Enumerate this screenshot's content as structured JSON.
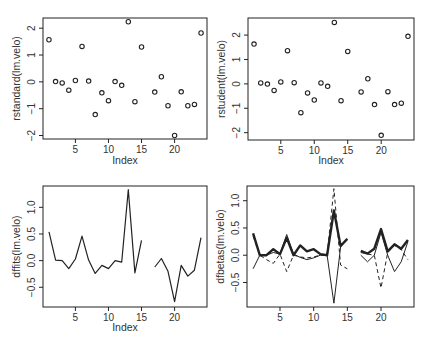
{
  "figure": {
    "layout": "2x2",
    "background": "#ffffff",
    "ink": "#222222"
  },
  "chart_data": [
    {
      "id": "rstandard",
      "type": "scatter",
      "title": "",
      "xlabel": "Index",
      "ylabel": "rstandard(lm.velo)",
      "xticks": [
        5,
        10,
        15,
        20
      ],
      "yticks": [
        -2,
        -1,
        0,
        1,
        2
      ],
      "ytick_labels": [
        "-2",
        "-1",
        "0",
        "1",
        "2"
      ],
      "xlim": [
        0.1,
        24.9
      ],
      "ylim": [
        -2.13,
        2.38
      ],
      "grid": false,
      "marker": "open-circle",
      "x": [
        1,
        2,
        3,
        4,
        5,
        6,
        7,
        8,
        9,
        10,
        11,
        12,
        13,
        14,
        15,
        16,
        17,
        18,
        19,
        20,
        21,
        22,
        23,
        24
      ],
      "values": [
        1.57,
        0.01,
        -0.04,
        -0.31,
        0.05,
        1.32,
        0.03,
        -1.22,
        -0.41,
        -0.7,
        0.01,
        -0.13,
        2.24,
        -0.74,
        1.3,
        null,
        -0.38,
        0.19,
        -0.89,
        -2.0,
        -0.37,
        -0.89,
        -0.84,
        1.82
      ]
    },
    {
      "id": "rstudent",
      "type": "scatter",
      "title": "",
      "xlabel": "Index",
      "ylabel": "rstudent(lm.velo)",
      "xticks": [
        5,
        10,
        15,
        20
      ],
      "yticks": [
        -2,
        -1,
        0,
        1,
        2
      ],
      "ytick_labels": [
        "-2",
        "-1",
        "0",
        "1",
        "2"
      ],
      "xlim": [
        0.1,
        24.9
      ],
      "ylim": [
        -2.3,
        2.7
      ],
      "grid": false,
      "marker": "open-circle",
      "x": [
        1,
        2,
        3,
        4,
        5,
        6,
        7,
        8,
        9,
        10,
        11,
        12,
        13,
        14,
        15,
        16,
        17,
        18,
        19,
        20,
        21,
        22,
        23,
        24
      ],
      "values": [
        1.63,
        0.04,
        -0.01,
        -0.27,
        0.08,
        1.36,
        0.05,
        -1.18,
        -0.37,
        -0.66,
        0.04,
        -0.1,
        2.52,
        -0.69,
        1.33,
        null,
        -0.33,
        0.21,
        -0.85,
        -2.11,
        -0.32,
        -0.85,
        -0.79,
        1.95
      ]
    },
    {
      "id": "dffits",
      "type": "line",
      "title": "",
      "xlabel": "Index",
      "ylabel": "dffits(lm.velo)",
      "xticks": [
        5,
        10,
        15,
        20
      ],
      "yticks": [
        -0.5,
        0.0,
        0.5,
        1.0
      ],
      "ytick_labels": [
        "-0.5",
        "0.0",
        "0.5",
        "1.0"
      ],
      "xlim": [
        0.1,
        24.9
      ],
      "ylim": [
        -0.87,
        1.4
      ],
      "grid": false,
      "x": [
        1,
        2,
        3,
        4,
        5,
        6,
        7,
        8,
        9,
        10,
        11,
        12,
        13,
        14,
        15,
        16,
        17,
        18,
        19,
        20,
        21,
        22,
        23,
        24
      ],
      "values": [
        0.54,
        0.01,
        0.0,
        -0.15,
        0.03,
        0.46,
        0.01,
        -0.24,
        -0.09,
        -0.15,
        0.0,
        -0.03,
        1.33,
        -0.23,
        0.38,
        null,
        -0.12,
        0.04,
        -0.2,
        -0.77,
        -0.09,
        -0.29,
        -0.18,
        0.43
      ]
    },
    {
      "id": "dfbetas",
      "type": "line",
      "title": "",
      "xlabel": "",
      "ylabel": "dfbetas(lm.velo)",
      "xticks": [
        5,
        10,
        15,
        20
      ],
      "yticks": [
        -0.5,
        0.0,
        0.5,
        1.0
      ],
      "ytick_labels": [
        "-0.5",
        "0.0",
        "0.5",
        "1.0"
      ],
      "xlim": [
        0.1,
        24.9
      ],
      "ylim": [
        -0.95,
        1.27
      ],
      "grid": false,
      "x": [
        1,
        2,
        3,
        4,
        5,
        6,
        7,
        8,
        9,
        10,
        11,
        12,
        13,
        14,
        15,
        16,
        17,
        18,
        19,
        20,
        21,
        22,
        23,
        24
      ],
      "series": [
        {
          "name": "column 1",
          "style": "solid-thick",
          "values": [
            0.4,
            0.0,
            0.0,
            0.11,
            0.02,
            0.32,
            0.0,
            0.18,
            0.07,
            0.11,
            0.02,
            0.0,
            0.82,
            0.17,
            0.3,
            null,
            0.08,
            0.03,
            0.12,
            0.48,
            0.07,
            0.2,
            0.12,
            0.28
          ]
        },
        {
          "name": "column 2",
          "style": "solid-thin",
          "values": [
            -0.25,
            0.0,
            0.0,
            0.05,
            0.02,
            0.38,
            0.02,
            -0.04,
            -0.08,
            -0.05,
            0.0,
            0.0,
            -0.88,
            0.15,
            0.3,
            null,
            0.0,
            -0.12,
            0.0,
            0.42,
            0.0,
            -0.3,
            -0.12,
            0.25
          ]
        },
        {
          "name": "column 3",
          "style": "dashed",
          "values": [
            0.35,
            0.0,
            -0.08,
            -0.15,
            0.02,
            -0.3,
            0.0,
            -0.03,
            -0.05,
            -0.03,
            0.0,
            0.0,
            1.22,
            -0.18,
            -0.25,
            null,
            0.05,
            0.02,
            0.0,
            -0.6,
            0.05,
            0.18,
            0.1,
            -0.08
          ]
        }
      ]
    }
  ]
}
